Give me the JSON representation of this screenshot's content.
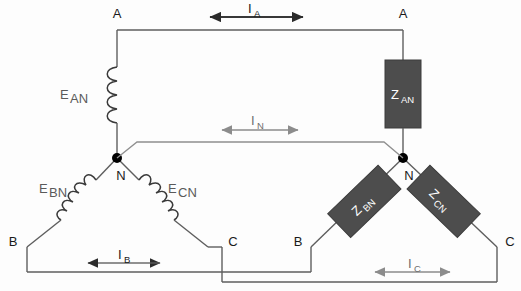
{
  "figure": {
    "colors": {
      "wire": "#5e5e5e",
      "wire_dark": "#3a3a3a",
      "impedance_fill": "#4d4d4d",
      "impedance_text": "#ffffff",
      "node": "#000000",
      "arrow_dark": "#2b2b2b",
      "arrow_light": "#8c8c8c",
      "label": "#1a1a1a",
      "label_gray": "#6b6b6b",
      "background": "#fdfdfd"
    }
  },
  "source": {
    "name": "wye-source",
    "terminals": [
      {
        "id": "source-terminal-a",
        "label": "A"
      },
      {
        "id": "source-terminal-b",
        "label": "B"
      },
      {
        "id": "source-terminal-c",
        "label": "C"
      }
    ],
    "neutral": {
      "id": "source-neutral",
      "label": "N"
    },
    "emf_sources": [
      {
        "id": "emf-an",
        "base": "E",
        "sub": "AN"
      },
      {
        "id": "emf-bn",
        "base": "E",
        "sub": "BN"
      },
      {
        "id": "emf-cn",
        "base": "E",
        "sub": "CN"
      }
    ]
  },
  "load": {
    "name": "wye-load",
    "terminals": [
      {
        "id": "load-terminal-a",
        "label": "A"
      },
      {
        "id": "load-terminal-b",
        "label": "B"
      },
      {
        "id": "load-terminal-c",
        "label": "C"
      }
    ],
    "neutral": {
      "id": "load-neutral",
      "label": "N"
    },
    "impedances": [
      {
        "id": "impedance-an",
        "base": "Z",
        "sub": "AN"
      },
      {
        "id": "impedance-bn",
        "base": "Z",
        "sub": "BN"
      },
      {
        "id": "impedance-cn",
        "base": "Z",
        "sub": "CN"
      }
    ]
  },
  "currents": [
    {
      "id": "current-a",
      "base": "I",
      "sub": "A",
      "style": "dark"
    },
    {
      "id": "current-n",
      "base": "I",
      "sub": "N",
      "style": "light"
    },
    {
      "id": "current-b",
      "base": "I",
      "sub": "B",
      "style": "dark"
    },
    {
      "id": "current-c",
      "base": "I",
      "sub": "C",
      "style": "light"
    }
  ]
}
